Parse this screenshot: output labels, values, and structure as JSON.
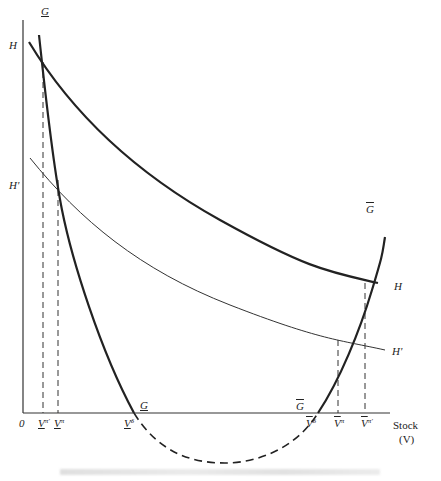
{
  "diagram": {
    "type": "economics-stock-curves",
    "axis": {
      "origin_label": "0",
      "x_label_line1": "Stock",
      "x_label_line2": "(V)"
    },
    "curves": {
      "H": {
        "label_left": "H",
        "label_right": "H",
        "style": "thick solid"
      },
      "H_prime": {
        "label_left": "H'",
        "label_right": "H'",
        "style": "thin solid"
      },
      "G": {
        "label_top_left": "G",
        "label_top_right": "G",
        "label_mid_left": "G",
        "label_mid_right": "G",
        "style": "thick solid, dashed below axis"
      }
    },
    "x_ticks": [
      {
        "base": "V",
        "sup": "π'",
        "mark": "underline"
      },
      {
        "base": "V",
        "sup": "π",
        "mark": "underline"
      },
      {
        "base": "V",
        "sup": "δ",
        "mark": "underline"
      },
      {
        "base": "V",
        "sup": "δ",
        "mark": "overline"
      },
      {
        "base": "V",
        "sup": "π",
        "mark": "overline"
      },
      {
        "base": "V",
        "sup": "π'",
        "mark": "overline"
      }
    ],
    "colors": {
      "line": "#222222",
      "background": "#ffffff"
    }
  }
}
